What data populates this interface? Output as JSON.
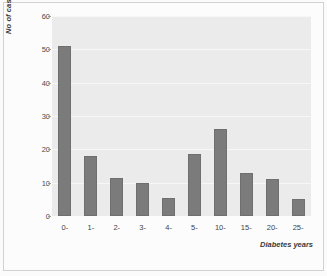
{
  "chart_data": {
    "type": "bar",
    "title": "",
    "xlabel": "Diabetes years",
    "ylabel": "No of cases",
    "categories": [
      "0-",
      "1-",
      "2-",
      "3-",
      "4-",
      "5-",
      "10-",
      "15-",
      "20-",
      "25-"
    ],
    "values": [
      51,
      18,
      11.5,
      10,
      5.5,
      18.5,
      26,
      13,
      11,
      5
    ],
    "ylim": [
      0,
      60
    ],
    "yticks": [
      0,
      10,
      20,
      30,
      40,
      50,
      60
    ],
    "grid": true,
    "legend": "none",
    "bar_color": "#7b7b7b",
    "panel_color": "#ebebeb",
    "gridline_color": "#f7f7f7"
  }
}
